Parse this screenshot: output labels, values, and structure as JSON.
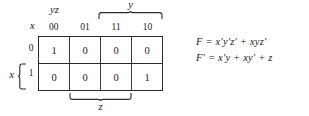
{
  "kmap": {
    "corner": {
      "top_label": "yz",
      "left_label": "x"
    },
    "column_headers": [
      "00",
      "01",
      "11",
      "10"
    ],
    "row_headers": [
      "0",
      "1"
    ],
    "cells": [
      [
        "1",
        "0",
        "0",
        "0"
      ],
      [
        "0",
        "0",
        "0",
        "1"
      ]
    ],
    "braces": {
      "top_label": "y",
      "bottom_label": "z",
      "left_label": "x"
    }
  },
  "equations": {
    "line1": "F = x′y′z′ + xyz′",
    "line2": "F′ = x′y + xy′ + z"
  },
  "colors": {
    "ink": "#1a1a1a",
    "grid_border": "#2b2b2b",
    "grid_inner": "#3a3a3a",
    "background": "#ffffff"
  }
}
